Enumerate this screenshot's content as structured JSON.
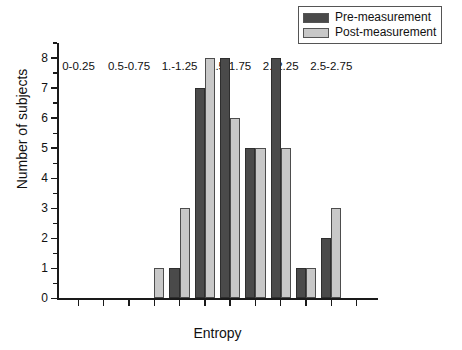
{
  "chart_data": {
    "type": "bar",
    "title": "",
    "xlabel": "Entropy",
    "ylabel": "Number of subjects",
    "ylim": [
      0,
      8
    ],
    "yticks": [
      0,
      1,
      2,
      3,
      4,
      5,
      6,
      7,
      8
    ],
    "ytick_labels": [
      "0",
      "1",
      "2",
      "3",
      "4",
      "5",
      "6",
      "7",
      "8"
    ],
    "grid": false,
    "legend_position": "top-right",
    "categories": [
      "0-0.25",
      "0.25-0.5",
      "0.5-0.75",
      "0.75-1.",
      "1.-1.25",
      "1.25-1.5",
      "1.5-1.75",
      "1.75-2.",
      "2.-2.25",
      "2.25-2.5",
      "2.5-2.75",
      "2.75-3."
    ],
    "xtick_labels": [
      "0-0.25",
      "0.5-0.75",
      "1.-1.25",
      "1.5-1.75",
      "2.-2.25",
      "2.5-2.75"
    ],
    "xtick_label_indices": [
      0,
      2,
      4,
      6,
      8,
      10
    ],
    "series": [
      {
        "name": "Pre-measurement",
        "color": "#4a4a4a",
        "values": [
          0,
          0,
          0,
          0,
          1,
          7,
          8,
          5,
          8,
          1,
          2,
          0
        ]
      },
      {
        "name": "Post-measurement",
        "color": "#c8c8c8",
        "values": [
          0,
          0,
          0,
          1,
          3,
          8,
          6,
          5,
          5,
          1,
          3,
          0
        ]
      }
    ]
  },
  "legend": {
    "items": [
      {
        "label": "Pre-measurement",
        "swatch": "pre"
      },
      {
        "label": "Post-measurement",
        "swatch": "post"
      }
    ]
  },
  "axes": {
    "x_title": "Entropy",
    "y_title": "Number of subjects"
  },
  "colors": {
    "pre": "#4a4a4a",
    "post": "#c8c8c8",
    "axis": "#1a1a1a",
    "background": "#ffffff"
  }
}
